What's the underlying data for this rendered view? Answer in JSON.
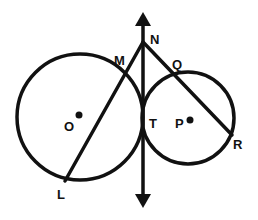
{
  "diagram": {
    "labels": {
      "N": "N",
      "M": "M",
      "Q": "Q",
      "O": "O",
      "T": "T",
      "P": "P",
      "R": "R",
      "L": "L"
    },
    "colors": {
      "stroke": "#111111",
      "background": "#ffffff"
    }
  }
}
